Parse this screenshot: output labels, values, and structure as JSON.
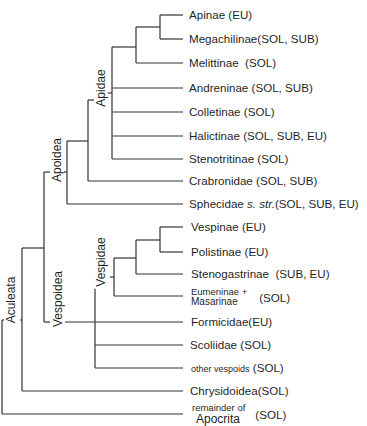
{
  "diagram": {
    "type": "phylogenetic-tree",
    "line_color": "#333333",
    "groups": [
      {
        "id": "apidae",
        "label": "Apidae"
      },
      {
        "id": "apoidea",
        "label": "Apoidea"
      },
      {
        "id": "vespidae",
        "label": "Vespidae"
      },
      {
        "id": "vespoidea",
        "label": "Vespoidea"
      },
      {
        "id": "aculeata",
        "label": "Aculeata"
      }
    ],
    "leaves": [
      {
        "name": "Apinae",
        "traits": "(EU)"
      },
      {
        "name": "Megachilinae",
        "traits": "(SOL, SUB)"
      },
      {
        "name": "Melittinae",
        "traits": "(SOL)"
      },
      {
        "name": "Andreninae",
        "traits": "(SOL, SUB)"
      },
      {
        "name": "Colletinae",
        "traits": "(SOL)"
      },
      {
        "name": "Halictinae",
        "traits": "(SOL, SUB, EU)"
      },
      {
        "name": "Stenotritinae",
        "traits": "(SOL)"
      },
      {
        "name": "Crabronidae",
        "traits": "(SOL, SUB)"
      },
      {
        "name": "Sphecidae",
        "name_italic": "s. str.",
        "traits": "(SOL, SUB, EU)"
      },
      {
        "name": "Vespinae",
        "traits": "(EU)"
      },
      {
        "name": "Polistinae",
        "traits": "(EU)"
      },
      {
        "name": "Stenogastrinae",
        "traits": "(SUB, EU)"
      },
      {
        "name_line1": "Eumeninae +",
        "name_line2": "Masarinae",
        "traits": "(SOL)"
      },
      {
        "name": "Formicidae",
        "traits": "(EU)"
      },
      {
        "name": "Scoliidae",
        "traits": "(SOL)"
      },
      {
        "name": "other vespoids",
        "traits": "(SOL)"
      },
      {
        "name": "Chrysidoidea",
        "traits": "(SOL)"
      },
      {
        "name_line1": "remainder of",
        "name_line2": "Apocrita",
        "traits": "(SOL)"
      }
    ]
  }
}
